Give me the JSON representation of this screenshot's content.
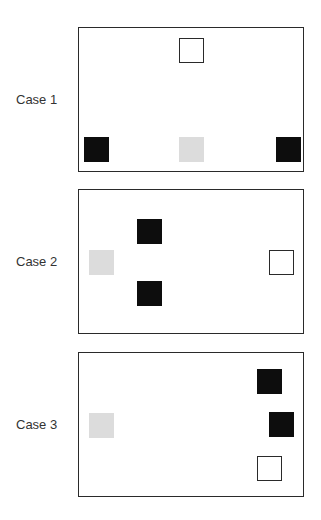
{
  "figure": {
    "cases": [
      {
        "label": "Case 1",
        "label_pos": {
          "left": 16,
          "top": 93
        },
        "panel_top": 27,
        "squares": [
          {
            "type": "white",
            "left": 100,
            "top": 10
          },
          {
            "type": "black",
            "left": 5,
            "top": 109
          },
          {
            "type": "gray",
            "left": 100,
            "top": 109
          },
          {
            "type": "black",
            "left": 197,
            "top": 109
          }
        ]
      },
      {
        "label": "Case 2",
        "label_pos": {
          "left": 16,
          "top": 255
        },
        "panel_top": 189,
        "squares": [
          {
            "type": "black",
            "left": 58,
            "top": 29
          },
          {
            "type": "gray",
            "left": 10,
            "top": 60
          },
          {
            "type": "white",
            "left": 190,
            "top": 60
          },
          {
            "type": "black",
            "left": 58,
            "top": 91
          }
        ]
      },
      {
        "label": "Case 3",
        "label_pos": {
          "left": 16,
          "top": 418
        },
        "panel_top": 352,
        "squares": [
          {
            "type": "black",
            "left": 178,
            "top": 16
          },
          {
            "type": "gray",
            "left": 10,
            "top": 60
          },
          {
            "type": "black",
            "left": 190,
            "top": 59
          },
          {
            "type": "white",
            "left": 178,
            "top": 103
          }
        ]
      }
    ],
    "colors": {
      "black_square": "#0d0d0d",
      "gray_square": "#dcdcdc",
      "white_square": "#ffffff",
      "border": "#2a2a2a"
    }
  }
}
